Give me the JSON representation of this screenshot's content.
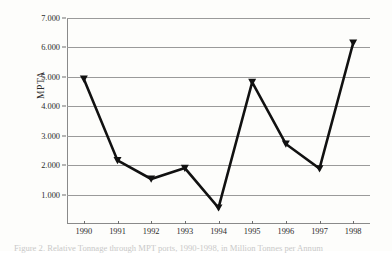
{
  "figure": {
    "background_color": "#fdfdfb",
    "line_color": "#111111",
    "grid_color": "#9a9a9a",
    "axis_color": "#8a8a8a",
    "text_color": "#2b2b2b",
    "caption": "Figure 2. Relative Tonnage through MPT ports, 1990-1998, in Million Tonnes per Annum"
  },
  "chart_data": {
    "type": "line",
    "title": "",
    "xlabel": "",
    "ylabel": "MPTA",
    "categories": [
      "1990",
      "1991",
      "1992",
      "1993",
      "1994",
      "1995",
      "1996",
      "1997",
      "1998"
    ],
    "values": [
      4.93,
      2.16,
      1.53,
      1.9,
      0.55,
      4.82,
      2.72,
      1.88,
      6.15
    ],
    "series": [
      {
        "name": "MPTA",
        "values": [
          4.93,
          2.16,
          1.53,
          1.9,
          0.55,
          4.82,
          2.72,
          1.88,
          6.15
        ]
      }
    ],
    "ylim": [
      0,
      7
    ],
    "xlim": [
      "1990",
      "1998"
    ],
    "y_ticks": [
      1,
      2,
      3,
      4,
      5,
      6,
      7
    ],
    "y_tick_labels": [
      "1.000",
      "2.000",
      "3.000",
      "4.000",
      "5.000",
      "6.000",
      "7.000"
    ],
    "x_tick_labels": [
      "1990",
      "1991",
      "1992",
      "1993",
      "1994",
      "1995",
      "1996",
      "1997",
      "1998"
    ],
    "grid": "horizontal",
    "legend": "none",
    "marker": "filled-triangle",
    "line_width": 2.6
  }
}
